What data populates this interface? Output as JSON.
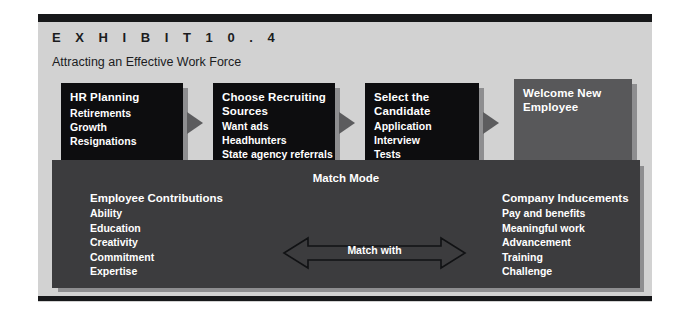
{
  "exhibit": {
    "label": "E X H I B I T     1 0 . 4",
    "subtitle": "Attracting an Effective Work Force"
  },
  "colors": {
    "page_background": "#ffffff",
    "panel_background": "#d2d2d2",
    "panel_bar": "#17181a",
    "box_dark": "#0d0d0f",
    "box_medium": "#58585a",
    "match_panel": "#3c3c3e",
    "shadow": "#8e8e90",
    "arrow": "#5c5c5e",
    "text_light": "#ffffff",
    "text_dark": "#1b1c1e"
  },
  "flow": {
    "arrow_icon": "triangle-right-icon",
    "steps": [
      {
        "title": "HR Planning",
        "items": [
          "Retirements",
          "Growth",
          "Resignations"
        ],
        "style": "dark"
      },
      {
        "title": "Choose Recruiting\nSources",
        "items": [
          "Want ads",
          "Headhunters",
          "State agency referrals"
        ],
        "style": "dark"
      },
      {
        "title": "Select the\nCandidate",
        "items": [
          "Application",
          "Interview",
          "Tests"
        ],
        "style": "dark"
      },
      {
        "title": "Welcome New\nEmployee",
        "items": [],
        "style": "medium"
      }
    ]
  },
  "match": {
    "heading": "Match Mode",
    "arrow_label": "Match with",
    "arrow_icon": "double-arrow-horizontal-icon",
    "left": {
      "title": "Employee Contributions",
      "items": [
        "Ability",
        "Education",
        "Creativity",
        "Commitment",
        "Expertise"
      ]
    },
    "right": {
      "title": "Company Inducements",
      "items": [
        "Pay and benefits",
        "Meaningful work",
        "Advancement",
        "Training",
        "Challenge"
      ]
    }
  }
}
